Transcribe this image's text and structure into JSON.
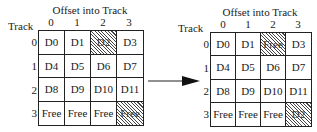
{
  "diagram": {
    "arrow": {
      "direction": "right",
      "icon": "right-arrow-icon"
    },
    "before": {
      "title": "Offset into Track",
      "row_axis_label": "Track",
      "column_labels": [
        "0",
        "1",
        "2",
        "3"
      ],
      "row_labels": [
        "0",
        "1",
        "2",
        "3"
      ],
      "rows": [
        [
          {
            "text": "D0",
            "hatched": false
          },
          {
            "text": "D1",
            "hatched": false
          },
          {
            "text": "D2",
            "hatched": true
          },
          {
            "text": "D3",
            "hatched": false
          }
        ],
        [
          {
            "text": "D4",
            "hatched": false
          },
          {
            "text": "D5",
            "hatched": false
          },
          {
            "text": "D6",
            "hatched": false
          },
          {
            "text": "D7",
            "hatched": false
          }
        ],
        [
          {
            "text": "D8",
            "hatched": false
          },
          {
            "text": "D9",
            "hatched": false
          },
          {
            "text": "D10",
            "hatched": false
          },
          {
            "text": "D11",
            "hatched": false
          }
        ],
        [
          {
            "text": "Free",
            "hatched": false
          },
          {
            "text": "Free",
            "hatched": false
          },
          {
            "text": "Free",
            "hatched": false
          },
          {
            "text": "Free",
            "hatched": true
          }
        ]
      ]
    },
    "after": {
      "title": "Offset into Track",
      "row_axis_label": "Track",
      "column_labels": [
        "0",
        "1",
        "2",
        "3"
      ],
      "row_labels": [
        "0",
        "1",
        "2",
        "3"
      ],
      "rows": [
        [
          {
            "text": "D0",
            "hatched": false
          },
          {
            "text": "D1",
            "hatched": false
          },
          {
            "text": "Free",
            "hatched": true
          },
          {
            "text": "D3",
            "hatched": false
          }
        ],
        [
          {
            "text": "D4",
            "hatched": false
          },
          {
            "text": "D5",
            "hatched": false
          },
          {
            "text": "D6",
            "hatched": false
          },
          {
            "text": "D7",
            "hatched": false
          }
        ],
        [
          {
            "text": "D8",
            "hatched": false
          },
          {
            "text": "D9",
            "hatched": false
          },
          {
            "text": "D10",
            "hatched": false
          },
          {
            "text": "D11",
            "hatched": false
          }
        ],
        [
          {
            "text": "Free",
            "hatched": false
          },
          {
            "text": "Free",
            "hatched": false
          },
          {
            "text": "Free",
            "hatched": false
          },
          {
            "text": "D2",
            "hatched": true
          }
        ]
      ]
    }
  },
  "colors": {
    "line": "#222222",
    "hatch": "#444444",
    "background": "#ffffff",
    "text": "#1a1a1a"
  }
}
